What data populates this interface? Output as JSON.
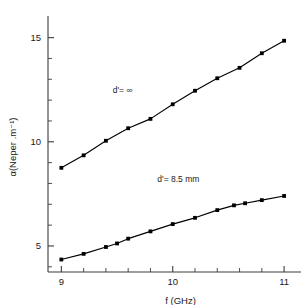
{
  "chart_data": {
    "type": "line",
    "title": "",
    "subtitle": "",
    "xlabel": "f (GHz)",
    "ylabel": "α(Neper .m⁻¹)",
    "xlim": [
      8.88,
      11.08
    ],
    "ylim": [
      3.75,
      15.75
    ],
    "grid": false,
    "legend_position": "inline-annotations",
    "x_major_ticks": [
      9,
      10,
      11
    ],
    "x_major_ticklabels": [
      "9",
      "10",
      "11"
    ],
    "x_minor_tick_step": 0.2,
    "y_major_ticks": [
      5,
      10,
      15
    ],
    "y_major_ticklabels": [
      "5",
      "10",
      "15"
    ],
    "y_minor_tick_step": 1,
    "marker": "filled-square",
    "line_color": "#000000",
    "series": [
      {
        "name": "d'= ∞",
        "label": "d'= ∞",
        "label_x": 9.55,
        "label_y": 12.35,
        "x": [
          9.0,
          9.2,
          9.4,
          9.6,
          9.8,
          10.0,
          10.2,
          10.4,
          10.6,
          10.8,
          11.0
        ],
        "values": [
          8.75,
          9.35,
          10.05,
          10.65,
          11.1,
          11.8,
          12.45,
          13.05,
          13.55,
          14.25,
          14.85
        ]
      },
      {
        "name": "d'= 8.5 mm",
        "label": "d'= 8.5 mm",
        "label_x": 10.05,
        "label_y": 8.05,
        "x": [
          9.0,
          9.2,
          9.4,
          9.5,
          9.6,
          9.8,
          10.0,
          10.2,
          10.4,
          10.55,
          10.65,
          10.8,
          11.0
        ],
        "values": [
          4.35,
          4.62,
          4.95,
          5.12,
          5.35,
          5.7,
          6.05,
          6.35,
          6.72,
          6.95,
          7.05,
          7.2,
          7.4
        ]
      }
    ]
  },
  "axes": {
    "x_title": "f (GHz)",
    "y_title": "α(Neper .m⁻¹)"
  },
  "annotations": {
    "upper_curve_label": "d'= ∞",
    "lower_curve_label": "d'= 8.5 mm"
  }
}
